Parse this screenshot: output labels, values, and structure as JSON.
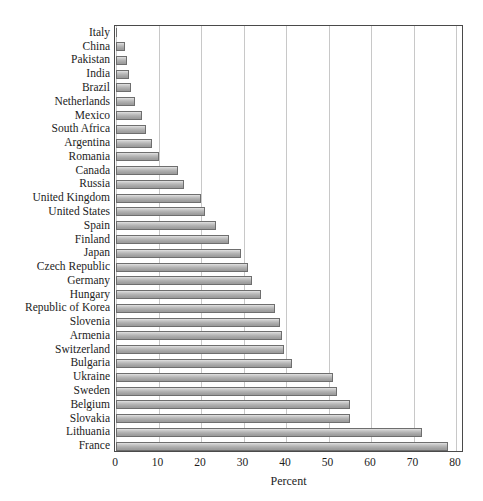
{
  "chart_data": {
    "type": "bar",
    "orientation": "horizontal",
    "title": "",
    "xlabel": "Percent",
    "ylabel": "",
    "xlim": [
      0,
      80
    ],
    "xticks": [
      0,
      10,
      20,
      30,
      40,
      50,
      60,
      70,
      80
    ],
    "grid": true,
    "legend": false,
    "categories": [
      "Italy",
      "China",
      "Pakistan",
      "India",
      "Brazil",
      "Netherlands",
      "Mexico",
      "South Africa",
      "Argentina",
      "Romania",
      "Canada",
      "Russia",
      "United Kingdom",
      "United States",
      "Spain",
      "Finland",
      "Japan",
      "Czech Republic",
      "Germany",
      "Hungary",
      "Republic of Korea",
      "Slovenia",
      "Armenia",
      "Switzerland",
      "Bulgaria",
      "Ukraine",
      "Sweden",
      "Belgium",
      "Slovakia",
      "Lithuania",
      "France"
    ],
    "values": [
      0.3,
      2.0,
      2.5,
      3.0,
      3.5,
      4.5,
      6.0,
      7.0,
      8.5,
      10.0,
      14.5,
      16.0,
      20.0,
      21.0,
      23.5,
      26.5,
      29.5,
      31.0,
      32.0,
      34.0,
      37.5,
      38.5,
      39.0,
      39.5,
      41.5,
      51.0,
      52.0,
      55.0,
      55.0,
      72.0,
      78.0
    ],
    "bar_color": "#b4b4b4",
    "bar_edge_color": "#6e6e6e",
    "grid_color": "#c8c8c8",
    "frame_color": "#4a4a4a"
  }
}
